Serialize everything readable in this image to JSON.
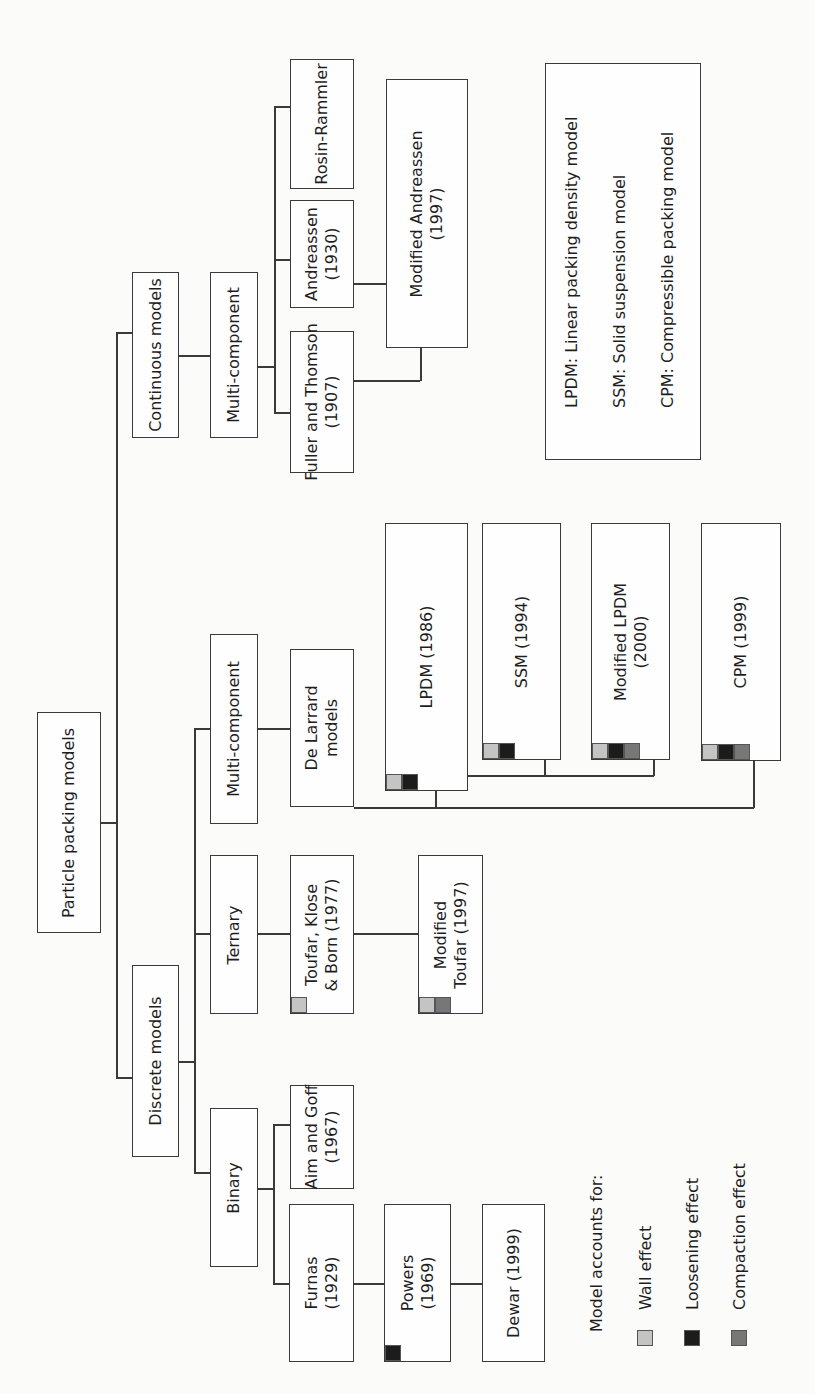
{
  "diagram": {
    "root": "Particle packing models",
    "branches": {
      "continuous": {
        "label": "Continuous models",
        "sub": "Multi-component",
        "models": [
          "Rosin-Rammler",
          "Andreassen\n(1930)",
          "Fuller and Thomson\n(1907)"
        ],
        "modified_andreassen": "Modified Andreassen\n(1997)"
      },
      "discrete": {
        "label": "Discrete models",
        "multi": "Multi-component",
        "ternary": "Ternary",
        "binary": "Binary",
        "de_larrard": "De Larrard\nmodels",
        "toufar": "Toufar, Klose\n& Born (1977)",
        "modified_toufar": "Modified\nToufar (1997)",
        "aim_goff": "Aim and Goff\n(1967)",
        "furnas": "Furnas\n(1929)",
        "powers": "Powers\n(1969)",
        "dewar": "Dewar (1999)",
        "lpdm": "LPDM (1986)",
        "ssm": "SSM (1994)",
        "modified_lpdm": "Modified LPDM\n(2000)",
        "cpm": "CPM (1999)"
      }
    },
    "abbreviations": [
      "LPDM: Linear packing density model",
      "SSM: Solid suspension model",
      "CPM: Compressible packing model"
    ],
    "legend": {
      "title": "Model accounts for:",
      "items": [
        {
          "label": "Wall effect",
          "color": "#c4c4c4"
        },
        {
          "label": "Loosening effect",
          "color": "#1c1c1c"
        },
        {
          "label": "Compaction effect",
          "color": "#777777"
        }
      ]
    }
  }
}
